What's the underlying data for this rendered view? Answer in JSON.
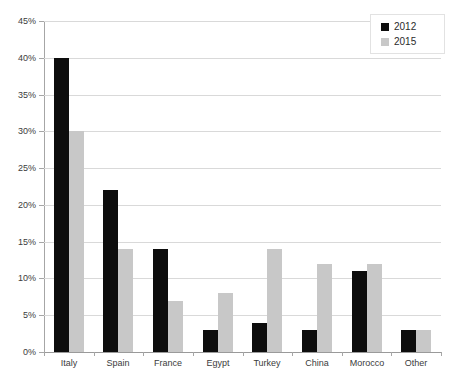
{
  "chart_data": {
    "type": "bar",
    "title": "",
    "subtitle": "",
    "xlabel": "",
    "ylabel": "",
    "categories": [
      "Italy",
      "Spain",
      "France",
      "Egypt",
      "Turkey",
      "China",
      "Morocco",
      "Other"
    ],
    "series": [
      {
        "name": "2012",
        "color": "#0d0d0d",
        "values": [
          40,
          22,
          14,
          3,
          4,
          3,
          11,
          3
        ]
      },
      {
        "name": "2015",
        "color": "#c8c8c8",
        "values": [
          30,
          14,
          7,
          8,
          14,
          12,
          12,
          3
        ]
      }
    ],
    "ylim": [
      0,
      45
    ],
    "ytick_step": 5,
    "ytick_labels": [
      "0%",
      "5%",
      "10%",
      "15%",
      "20%",
      "25%",
      "30%",
      "35%",
      "40%",
      "45%"
    ],
    "ytick_values": [
      0,
      5,
      10,
      15,
      20,
      25,
      30,
      35,
      40,
      45
    ],
    "grid": "horizontal",
    "legend_position": "top-right",
    "value_format": "percent"
  },
  "legend": {
    "entries": [
      {
        "label": "2012",
        "swatch": "#0d0d0d"
      },
      {
        "label": "2015",
        "swatch": "#c8c8c8"
      }
    ]
  }
}
